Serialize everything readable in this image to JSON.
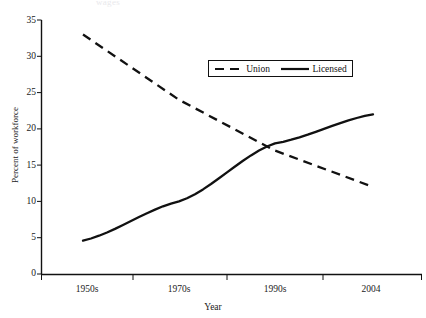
{
  "figure": {
    "background_color": "#ffffff",
    "line_color": "#111111",
    "cropped_title_remnant": "wages"
  },
  "chart_data": {
    "type": "line",
    "title": "",
    "xlabel": "Year",
    "ylabel": "Percent of workforce",
    "categories": [
      "1950s",
      "1970s",
      "1990s",
      "2004"
    ],
    "x_tick_labels": [
      "1950s",
      "1970s",
      "1990s",
      "2004"
    ],
    "y_tick_labels": [
      "0",
      "5",
      "10",
      "15",
      "20",
      "25",
      "30",
      "35"
    ],
    "y_ticks": [
      0,
      5,
      10,
      15,
      20,
      25,
      30,
      35
    ],
    "ylim": [
      0,
      35
    ],
    "grid": false,
    "legend_position": "upper-center",
    "series": [
      {
        "name": "Union",
        "style": "dashed",
        "color": "#111111",
        "values": [
          33,
          24,
          17,
          12
        ]
      },
      {
        "name": "Licensed",
        "style": "solid",
        "color": "#111111",
        "values": [
          4.6,
          10,
          18,
          22
        ]
      }
    ],
    "annotations": [
      {
        "text": "crossover between Union and Licensed",
        "approx_year": "late 1980s",
        "approx_value": 16.8
      }
    ]
  },
  "legend": {
    "entries": [
      {
        "label": "Union",
        "style": "dashed"
      },
      {
        "label": "Licensed",
        "style": "solid"
      }
    ]
  },
  "axes": {
    "x_title": "Year",
    "y_title": "Percent of workforce"
  }
}
